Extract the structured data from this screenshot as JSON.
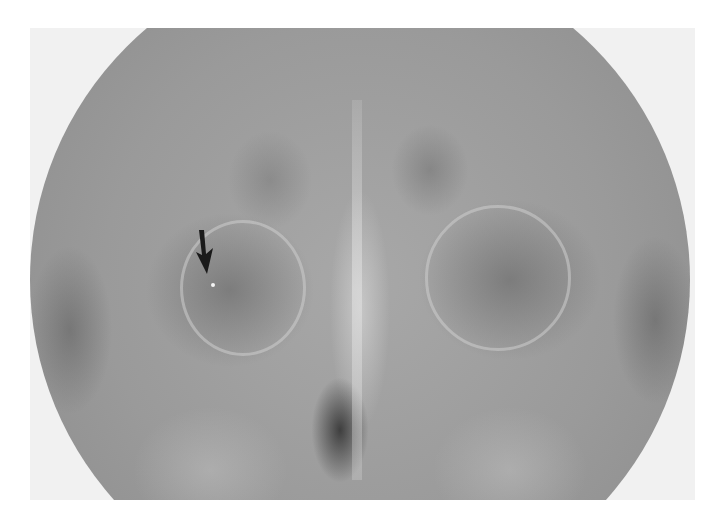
{
  "image": {
    "description": "Frontal radiograph of facial bones / paranasal sinuses within circular collimation field",
    "annotation": {
      "type": "arrow",
      "direction": "down",
      "color": "#1a1a1a",
      "target": "small radiopaque foreign body in right orbit region"
    },
    "colors": {
      "background": "#ffffff",
      "film_border": "#f1f1f1",
      "field_mid": "#9a9a9a",
      "dark_airway": "#303030"
    }
  }
}
